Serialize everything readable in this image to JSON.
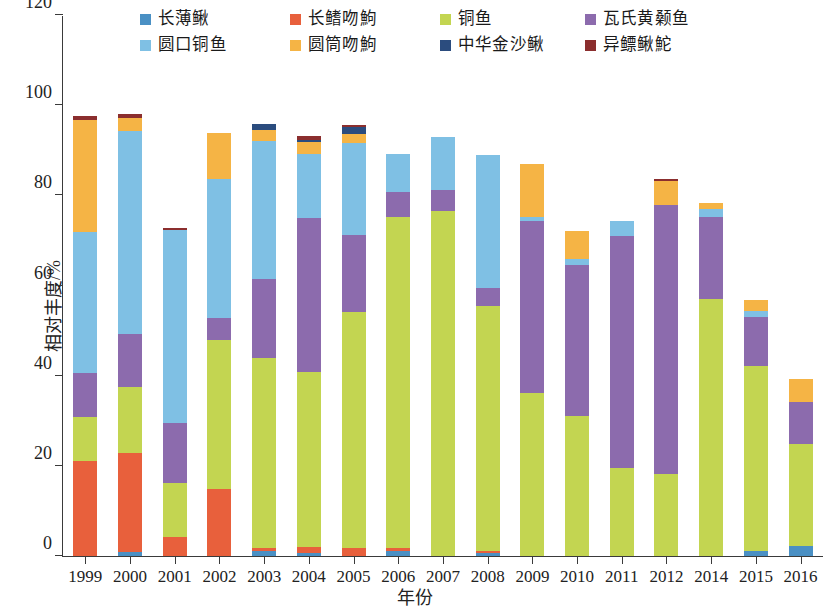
{
  "chart_data": {
    "type": "bar",
    "stacked": true,
    "title": "",
    "xlabel": "年份",
    "ylabel": "相对丰度/%",
    "ylim": [
      0,
      120
    ],
    "yticks": [
      0,
      20,
      40,
      60,
      80,
      100,
      120
    ],
    "grid": false,
    "legend_position": "top",
    "categories": [
      "1999",
      "2000",
      "2001",
      "2002",
      "2003",
      "2004",
      "2005",
      "2006",
      "2007",
      "2008",
      "2009",
      "2010",
      "2011",
      "2012",
      "2014",
      "2015",
      "2016"
    ],
    "series": [
      {
        "name": "长薄鳅",
        "color": "#4A90C4",
        "values": [
          0,
          0.8,
          0,
          0,
          1.2,
          0.6,
          0,
          1.2,
          0,
          0.7,
          0,
          0,
          0,
          0,
          0,
          1.2,
          2.2
        ]
      },
      {
        "name": "长鳍吻鮈",
        "color": "#E8603C",
        "values": [
          21.1,
          22.0,
          4.2,
          14.8,
          0.5,
          1.5,
          1.8,
          0.6,
          0,
          0.4,
          0,
          0,
          0,
          0,
          0,
          0,
          0
        ]
      },
      {
        "name": "铜鱼",
        "color": "#C3D551",
        "values": [
          9.7,
          14.8,
          12.0,
          33.2,
          42.3,
          38.8,
          52.3,
          73.5,
          76.5,
          54.4,
          36.2,
          31.0,
          19.6,
          18.2,
          57.0,
          41.0,
          22.7
        ]
      },
      {
        "name": "瓦氏黄颡鱼",
        "color": "#8C6BAD",
        "values": [
          9.7,
          11.7,
          13.2,
          4.9,
          17.5,
          34.0,
          17.0,
          5.4,
          4.6,
          4.0,
          38.2,
          33.5,
          51.4,
          59.6,
          18.3,
          10.8,
          9.3
        ]
      },
      {
        "name": "圆口铜鱼",
        "color": "#7FC0E4",
        "values": [
          31.3,
          44.9,
          42.9,
          30.7,
          30.6,
          14.2,
          20.6,
          8.4,
          11.9,
          29.4,
          0.9,
          1.3,
          3.3,
          0,
          1.7,
          1.3,
          0
        ]
      },
      {
        "name": "圆筒吻鮈",
        "color": "#F5B445",
        "values": [
          25.0,
          3.0,
          0,
          10.2,
          2.3,
          2.7,
          1.9,
          0,
          0,
          0,
          11.6,
          6.2,
          0,
          5.3,
          1.3,
          2.4,
          5.1
        ]
      },
      {
        "name": "中华金沙鳅",
        "color": "#2B4C7E",
        "values": [
          0,
          0,
          0,
          0,
          1.5,
          0.5,
          1.5,
          0,
          0,
          0,
          0,
          0,
          0,
          0,
          0,
          0,
          0
        ]
      },
      {
        "name": "异鳔鳅鮀",
        "color": "#8B2E2E",
        "values": [
          0.7,
          0.8,
          0.4,
          0,
          0,
          0.8,
          0.5,
          0,
          0,
          0,
          0,
          0,
          0,
          0.5,
          0,
          0,
          0
        ]
      }
    ]
  },
  "legend": {
    "items": [
      {
        "label": "长薄鳅",
        "color": "#4A90C4"
      },
      {
        "label": "长鳍吻鮈",
        "color": "#E8603C"
      },
      {
        "label": "铜鱼",
        "color": "#C3D551"
      },
      {
        "label": "瓦氏黄颡鱼",
        "color": "#8C6BAD"
      },
      {
        "label": "圆口铜鱼",
        "color": "#7FC0E4"
      },
      {
        "label": "圆筒吻鮈",
        "color": "#F5B445"
      },
      {
        "label": "中华金沙鳅",
        "color": "#2B4C7E"
      },
      {
        "label": "异鳔鳅鮀",
        "color": "#8B2E2E"
      }
    ]
  },
  "axes": {
    "y_title": "相对丰度/%",
    "x_title": "年份",
    "y_tick_labels": [
      "0",
      "20",
      "40",
      "60",
      "80",
      "100",
      "120"
    ],
    "x_tick_labels": [
      "1999",
      "2000",
      "2001",
      "2002",
      "2003",
      "2004",
      "2005",
      "2006",
      "2007",
      "2008",
      "2009",
      "2010",
      "2011",
      "2012",
      "2014",
      "2015",
      "2016"
    ]
  }
}
